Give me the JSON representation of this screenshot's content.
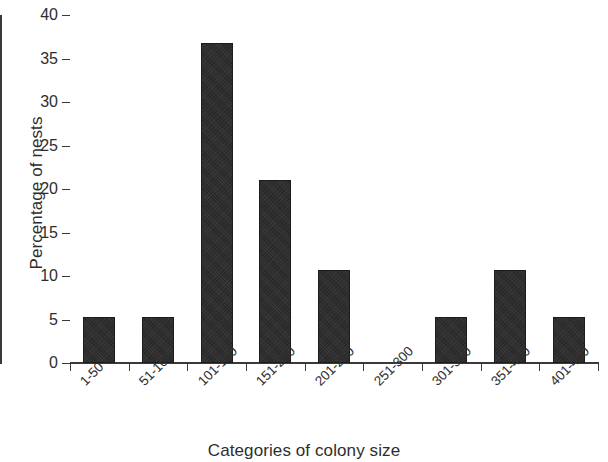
{
  "chart_data": {
    "type": "bar",
    "title": "",
    "xlabel": "Categories of colony size",
    "ylabel": "Percentage of nests",
    "categories": [
      "1-50",
      "51-100",
      "101-150",
      "151-200",
      "201-250",
      "251-300",
      "301-350",
      "351-400",
      "401-450"
    ],
    "values": [
      5.3,
      5.3,
      36.8,
      21.0,
      10.7,
      0,
      5.3,
      10.7,
      5.3
    ],
    "ylim": [
      0,
      40
    ],
    "ytick_labels": [
      "0",
      "5",
      "10",
      "15",
      "20",
      "25",
      "30",
      "35",
      "40"
    ],
    "ytick_values": [
      0,
      5,
      10,
      15,
      20,
      25,
      30,
      35,
      40
    ],
    "grid": false,
    "legend": null,
    "bar_color": "#272727",
    "axis_color": "#3a3a3a",
    "text_color": "#2e2e2e",
    "background_color": "#ffffff"
  }
}
